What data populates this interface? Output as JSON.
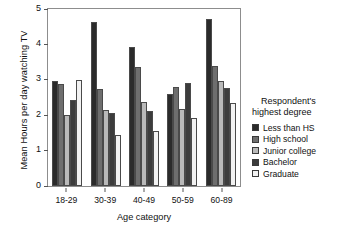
{
  "chart_data": {
    "type": "bar",
    "title": "",
    "xlabel": "Age category",
    "ylabel": "Mean Hours per day watching TV",
    "ylim": [
      0,
      5
    ],
    "yticks": [
      "0",
      "1",
      "2",
      "3",
      "4",
      "5"
    ],
    "grid": false,
    "legend_position": "right",
    "legend_title": "Respondent's highest degree",
    "categories": [
      "18-29",
      "30-39",
      "40-49",
      "50-59",
      "60-89"
    ],
    "series": [
      {
        "name": "Less than HS",
        "color": "#2b2b2b",
        "values": [
          2.97,
          4.64,
          3.93,
          2.61,
          4.71
        ]
      },
      {
        "name": "High school",
        "color": "#6e6e6e",
        "values": [
          2.89,
          2.74,
          3.35,
          2.8,
          3.4
        ]
      },
      {
        "name": "Junior college",
        "color": "#b9b9b9",
        "values": [
          2.01,
          2.16,
          2.36,
          2.17,
          2.98
        ]
      },
      {
        "name": "Bachelor",
        "color": "#3c3c3c",
        "values": [
          2.42,
          2.05,
          2.12,
          2.91,
          2.76
        ]
      },
      {
        "name": "Graduate",
        "color": "#f2f2f2",
        "values": [
          3.0,
          1.45,
          1.56,
          1.92,
          2.35
        ]
      }
    ]
  },
  "legend": {
    "title_line1": "Respondent's",
    "title_line2": "highest degree"
  },
  "axes": {
    "y_title": "Mean Hours per day watching TV",
    "x_title": "Age category"
  }
}
